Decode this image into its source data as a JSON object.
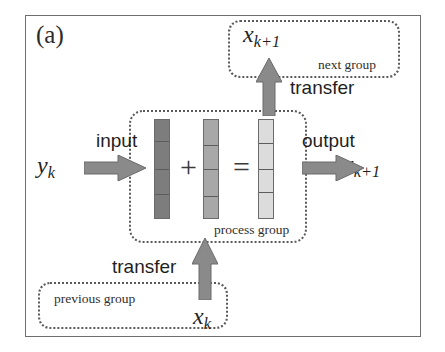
{
  "figure": {
    "panel_label": "(a)",
    "type": "block-diagram"
  },
  "groups": [
    {
      "id": "next-group",
      "caption": "next group",
      "style": "dotted-rounded-box"
    },
    {
      "id": "process-group",
      "caption": "process group",
      "style": "dotted-rounded-box"
    },
    {
      "id": "previous-group",
      "caption": "previous group",
      "style": "dotted-rounded-box"
    }
  ],
  "math_labels": {
    "x_next_top": {
      "base": "x",
      "sub": "k+1"
    },
    "y_input": {
      "base": "y",
      "sub": "k"
    },
    "x_output_right": {
      "base": "x",
      "sub": "k+1"
    },
    "x_state_bottom": {
      "base": "x",
      "sub": "k"
    }
  },
  "flow_labels": {
    "input": "input",
    "output": "output",
    "transfer_top": "transfer",
    "transfer_bottom": "transfer"
  },
  "operators": {
    "plus": "+",
    "equals": "="
  },
  "bars": [
    {
      "id": "input-vector",
      "role": "input",
      "fill": "#7d7d7d",
      "segments": [
        22,
        28,
        26,
        24
      ]
    },
    {
      "id": "state-vector",
      "role": "state",
      "fill": "#a8a8a8",
      "segments": [
        26,
        24,
        28,
        22
      ]
    },
    {
      "id": "output-vector",
      "role": "output",
      "fill": "#dcdcdc",
      "segments": [
        24,
        26,
        24,
        26
      ]
    }
  ],
  "colors": {
    "frame": "#6f6f6f",
    "dotted_box": "#5a5a5a",
    "arrow": "#8a8a8a",
    "arrow_stroke": "#6a6a6a",
    "text": "#1f1f1f",
    "background": "#ffffff"
  }
}
